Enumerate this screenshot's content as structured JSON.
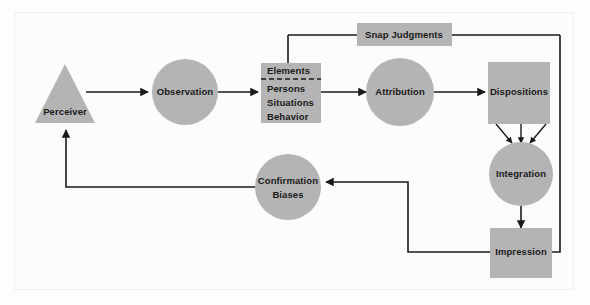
{
  "diagram": {
    "palette": {
      "shape_fill": "#b4b4b4",
      "background": "#fcfcfc",
      "line": "#1a1a1a",
      "frame": "#f0f0f0"
    },
    "nodes": [
      {
        "id": "perceiver",
        "shape": "triangle",
        "label": "Perceiver"
      },
      {
        "id": "observation",
        "shape": "circle",
        "label": "Observation"
      },
      {
        "id": "elements",
        "shape": "rect",
        "label": "Elements",
        "items": [
          "Persons",
          "Situations",
          "Behavior"
        ]
      },
      {
        "id": "attribution",
        "shape": "circle",
        "label": "Attribution"
      },
      {
        "id": "dispositions",
        "shape": "rect",
        "label": "Dispositions"
      },
      {
        "id": "snap",
        "shape": "rect",
        "label": "Snap Judgments"
      },
      {
        "id": "integration",
        "shape": "circle",
        "label": "Integration"
      },
      {
        "id": "impression",
        "shape": "rect",
        "label": "Impression"
      },
      {
        "id": "confirmation",
        "shape": "circle",
        "label": "Confirmation",
        "label2": "Biases"
      }
    ],
    "edges": [
      {
        "from": "perceiver",
        "to": "observation"
      },
      {
        "from": "observation",
        "to": "elements"
      },
      {
        "from": "elements",
        "to": "attribution"
      },
      {
        "from": "attribution",
        "to": "dispositions"
      },
      {
        "from": "dispositions",
        "to": "integration"
      },
      {
        "from": "integration",
        "to": "impression"
      },
      {
        "from": "impression",
        "to": "confirmation"
      },
      {
        "from": "confirmation",
        "to": "perceiver"
      },
      {
        "from": "snap",
        "to": "elements"
      },
      {
        "from": "snap",
        "to": "impression"
      }
    ]
  }
}
